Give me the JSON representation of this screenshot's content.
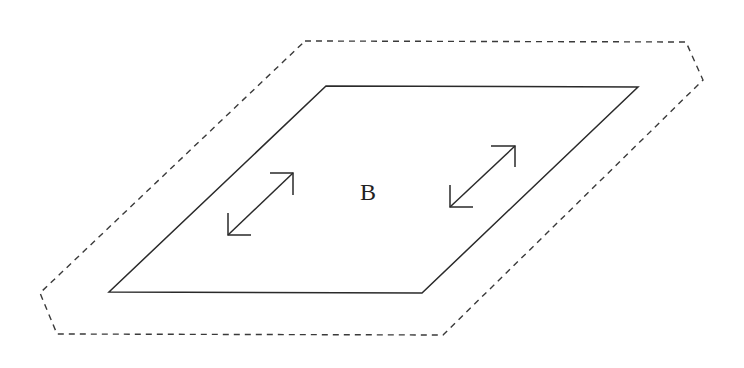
{
  "diagram": {
    "region_label": "B",
    "colors": {
      "stroke": "#2a2a2a",
      "dashed_stroke": "#3a3a3a",
      "background": "#ffffff"
    },
    "outer_boundary": {
      "style": "dashed",
      "points": "305,41 686,42 703,80 443,335 57,334 40,293"
    },
    "inner_plate": {
      "style": "solid",
      "points": "326,86 638,87 422,293 109,292"
    },
    "arrows": [
      {
        "name": "left-double-arrow",
        "x1": 227,
        "y1": 235,
        "x2": 293,
        "y2": 172
      },
      {
        "name": "right-double-arrow",
        "x1": 450,
        "y1": 207,
        "x2": 515,
        "y2": 146
      }
    ]
  }
}
